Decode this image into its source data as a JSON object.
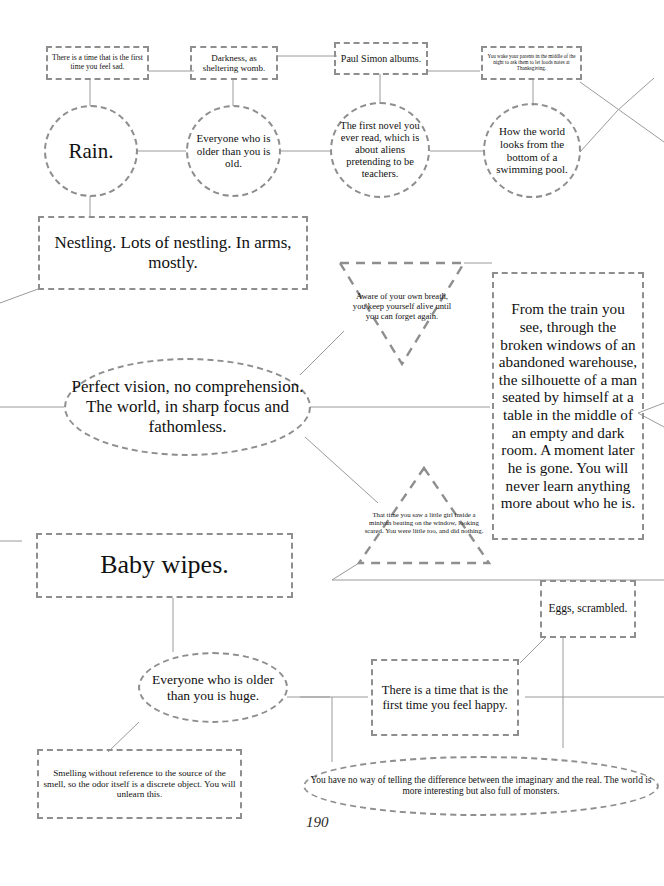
{
  "page": {
    "number": "190",
    "dash_color": "#8e8e8e",
    "line_color": "#9a9a9a",
    "text_color": "#111111",
    "background": "#ffffff"
  },
  "nodes": {
    "time_feel_sad": "There is a time that is the first time you feel sad.",
    "darkness_womb": "Darkness, as sheltering womb.",
    "paul_simon": "Paul Simon albums.",
    "wake_parents": "You wake your parents in the middle of the night to ask them to let foods notes at Thanksgiving.",
    "rain": "Rain.",
    "everyone_older_old": "Everyone who is older than you is old.",
    "first_novel": "The first novel you ever read, which is about aliens pretending to be teachers.",
    "bottom_of_pool": "How the world looks from the bottom of a swimming pool.",
    "nestling": "Nestling. Lots of nestling. In arms, mostly.",
    "aware_of_breath": "Aware of your own breath, you keep yourself alive until you can forget again.",
    "from_the_train": "From the train you see, through the broken windows of an abandoned warehouse, the silhouette of a man seated by himself at a table in the middle of an empty and dark room. A moment later he is gone. You will never learn anything more about who he is.",
    "perfect_vision": "Perfect vision, no comprehension. The world, in sharp focus and fathomless.",
    "minivan_girl": "That time you saw a little girl inside a minivan beating on the window, looking scared. You were little too, and did nothing.",
    "baby_wipes": "Baby wipes.",
    "eggs_scrambled": "Eggs, scrambled.",
    "everyone_older_huge": "Everyone who is older than you is huge.",
    "time_feel_happy": "There is a time that is the first time you feel happy.",
    "smelling_without_reference": "Smelling without reference to the source of the smell, so the odor itself is a discrete object. You will unlearn this.",
    "imaginary_and_real": "You have no way of telling the difference between the imaginary and the real. The world is more interesting but also full of monsters."
  }
}
